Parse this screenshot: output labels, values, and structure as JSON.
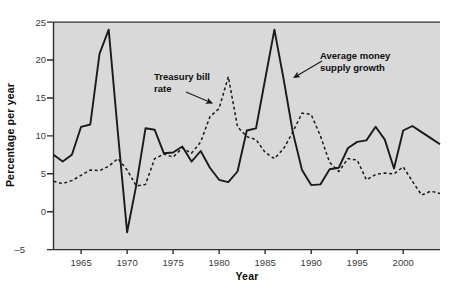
{
  "figure": {
    "y_axis_title": "Percentage per year",
    "x_axis_title": "Year",
    "annotations": {
      "treasury": {
        "label": "Treasury bill\nrate"
      },
      "money": {
        "label": "Average money\nsupply growth"
      }
    },
    "colors": {
      "plot_background": "#d9d9d9",
      "axis": "#2e2e2e",
      "line": "#1a1a1a",
      "tick_text": "#3a3a3a"
    }
  },
  "chart_data": {
    "type": "line",
    "title": "",
    "xlabel": "Year",
    "ylabel": "Percentage per year",
    "xlim": [
      1962,
      2004
    ],
    "ylim": [
      -5,
      25
    ],
    "x_ticks": [
      1965,
      1970,
      1975,
      1980,
      1985,
      1990,
      1995,
      2000
    ],
    "y_ticks": [
      25,
      20,
      15,
      10,
      5,
      0,
      -5
    ],
    "grid": false,
    "legend_position": "in-plot arrow annotations",
    "x": [
      1962,
      1963,
      1964,
      1965,
      1966,
      1967,
      1968,
      1969,
      1970,
      1971,
      1972,
      1973,
      1974,
      1975,
      1976,
      1977,
      1978,
      1979,
      1980,
      1981,
      1982,
      1983,
      1984,
      1985,
      1986,
      1987,
      1988,
      1989,
      1990,
      1991,
      1992,
      1993,
      1994,
      1995,
      1996,
      1997,
      1998,
      1999,
      2000,
      2001,
      2002,
      2003,
      2004
    ],
    "series": [
      {
        "name": "Average money supply growth",
        "style": "solid",
        "color": "#1a1a1a",
        "values": [
          7.5,
          6.6,
          7.5,
          11.2,
          11.5,
          20.8,
          24.0,
          10.4,
          -2.7,
          3.5,
          11.0,
          10.8,
          7.7,
          7.8,
          8.6,
          6.6,
          8.0,
          5.8,
          4.2,
          3.9,
          5.3,
          10.7,
          11.0,
          17.5,
          24.0,
          17.5,
          10.5,
          5.5,
          3.5,
          3.6,
          5.6,
          5.8,
          8.4,
          9.2,
          9.4,
          11.2,
          9.5,
          5.7,
          10.7,
          11.3,
          10.5,
          9.7,
          8.9
        ]
      },
      {
        "name": "Treasury bill rate",
        "style": "dashed",
        "color": "#1a1a1a",
        "values": [
          4.0,
          3.7,
          4.1,
          4.8,
          5.5,
          5.4,
          6.0,
          7.0,
          5.5,
          3.4,
          3.6,
          7.0,
          7.6,
          7.2,
          8.4,
          7.7,
          9.2,
          12.5,
          13.6,
          17.8,
          11.2,
          9.9,
          9.5,
          7.8,
          7.0,
          8.3,
          10.5,
          13.0,
          12.8,
          10.0,
          6.5,
          5.3,
          7.0,
          6.8,
          4.2,
          4.9,
          5.1,
          5.0,
          5.9,
          4.0,
          2.2,
          2.7,
          2.4
        ]
      }
    ]
  }
}
